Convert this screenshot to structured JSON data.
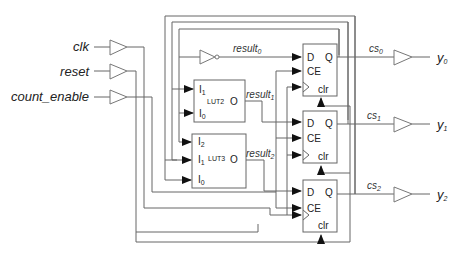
{
  "diagram": {
    "type": "synchronous counter circuit",
    "inputs": [
      {
        "label": "clk"
      },
      {
        "label": "reset"
      },
      {
        "label": "count_enable"
      }
    ],
    "outputs": [
      {
        "base": "y",
        "sub": "0"
      },
      {
        "base": "y",
        "sub": "1"
      },
      {
        "base": "y",
        "sub": "2"
      }
    ],
    "state_signals": [
      {
        "base": "cs",
        "sub": "0"
      },
      {
        "base": "cs",
        "sub": "1"
      },
      {
        "base": "cs",
        "sub": "2"
      }
    ],
    "result_signals": [
      {
        "base": "result",
        "sub": "0"
      },
      {
        "base": "result",
        "sub": "1"
      },
      {
        "base": "result",
        "sub": "2"
      }
    ],
    "luts": [
      {
        "name": "LUT2",
        "inputs": [
          {
            "base": "I",
            "sub": "1"
          },
          {
            "base": "I",
            "sub": "0"
          }
        ],
        "output": "O"
      },
      {
        "name": "LUT3",
        "inputs": [
          {
            "base": "I",
            "sub": "2"
          },
          {
            "base": "I",
            "sub": "1"
          },
          {
            "base": "I",
            "sub": "0"
          }
        ],
        "output": "O"
      }
    ],
    "flip_flop_ports": {
      "d": "D",
      "q": "Q",
      "ce": "CE",
      "clr": "clr"
    },
    "colors": {
      "wire": "#666666",
      "arrow": "#111111",
      "text": "#222222",
      "background": "#ffffff"
    }
  }
}
